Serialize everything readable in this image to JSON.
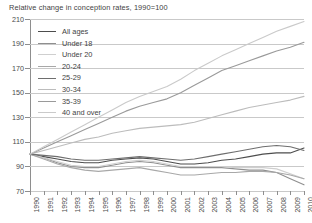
{
  "chart_data": {
    "type": "line",
    "title": "Relative change in conception rates, 1990=100",
    "xlabel": "",
    "ylabel": "",
    "xlim": [
      1990,
      2010
    ],
    "ylim": [
      70,
      210
    ],
    "yticks": [
      70,
      90,
      110,
      130,
      150,
      170,
      190,
      210
    ],
    "grid": true,
    "legend_position": "upper-left",
    "x": [
      1990,
      1991,
      1992,
      1993,
      1994,
      1995,
      1996,
      1997,
      1998,
      1999,
      2000,
      2001,
      2002,
      2003,
      2004,
      2005,
      2006,
      2007,
      2008,
      2009,
      2010
    ],
    "series": [
      {
        "name": "All ages",
        "color": "#4d4d4d",
        "values": [
          100,
          98,
          96,
          94,
          93,
          93,
          95,
          96,
          97,
          96,
          94,
          92,
          92,
          93,
          95,
          96,
          98,
          100,
          101,
          101,
          105
        ]
      },
      {
        "name": "Under 18",
        "color": "#8f8f8f",
        "values": [
          100,
          97,
          93,
          90,
          89,
          89,
          91,
          93,
          94,
          93,
          91,
          89,
          89,
          89,
          89,
          88,
          87,
          87,
          85,
          80,
          75
        ]
      },
      {
        "name": "Under 20",
        "color": "#cfcfcf",
        "values": [
          100,
          97,
          94,
          91,
          90,
          90,
          92,
          94,
          95,
          94,
          92,
          90,
          90,
          90,
          90,
          89,
          89,
          89,
          88,
          84,
          80
        ]
      },
      {
        "name": "20-24",
        "color": "#a8a8a8",
        "values": [
          100,
          96,
          92,
          89,
          87,
          86,
          87,
          88,
          89,
          87,
          85,
          83,
          83,
          84,
          85,
          85,
          86,
          86,
          85,
          83,
          80
        ]
      },
      {
        "name": "25-29",
        "color": "#6e6e6e",
        "values": [
          100,
          99,
          98,
          96,
          95,
          95,
          96,
          97,
          98,
          97,
          96,
          95,
          96,
          98,
          100,
          102,
          104,
          106,
          107,
          106,
          103
        ]
      },
      {
        "name": "30-34",
        "color": "#bcbcbc",
        "values": [
          100,
          103,
          106,
          109,
          112,
          114,
          117,
          119,
          121,
          122,
          123,
          124,
          126,
          129,
          132,
          135,
          138,
          140,
          142,
          144,
          147
        ]
      },
      {
        "name": "35-39",
        "color": "#9a9a9a",
        "values": [
          100,
          105,
          110,
          115,
          120,
          125,
          130,
          135,
          139,
          142,
          145,
          150,
          156,
          162,
          168,
          172,
          176,
          180,
          184,
          187,
          191
        ]
      },
      {
        "name": "40 and over",
        "color": "#cacaca",
        "values": [
          100,
          106,
          112,
          118,
          124,
          130,
          136,
          142,
          147,
          151,
          155,
          161,
          168,
          174,
          180,
          185,
          190,
          195,
          200,
          204,
          208
        ]
      }
    ]
  }
}
